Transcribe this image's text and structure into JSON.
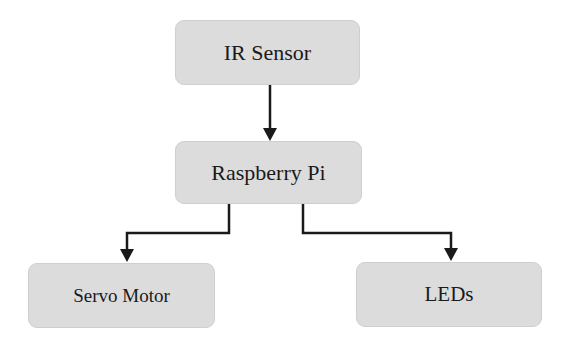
{
  "diagram": {
    "type": "block-diagram",
    "nodes": [
      {
        "id": "ir",
        "label": "IR Sensor"
      },
      {
        "id": "pi",
        "label": "Raspberry Pi"
      },
      {
        "id": "servo",
        "label": "Servo Motor"
      },
      {
        "id": "leds",
        "label": "LEDs"
      }
    ],
    "edges": [
      {
        "from": "IR Sensor",
        "to": "Raspberry Pi"
      },
      {
        "from": "Raspberry Pi",
        "to": "Servo Motor"
      },
      {
        "from": "Raspberry Pi",
        "to": "LEDs"
      }
    ],
    "colors": {
      "node_fill": "#dcdcdc",
      "line": "#1a1a1a",
      "text": "#1a1a1a"
    }
  }
}
